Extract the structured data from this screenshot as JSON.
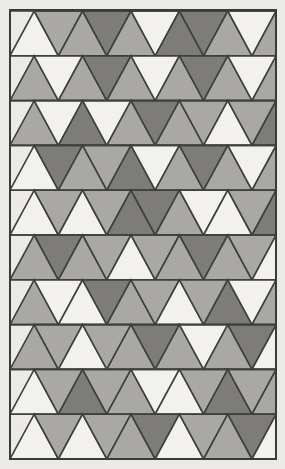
{
  "artwork": {
    "title": "Triangular Tessellation Pattern",
    "description": "Grid of equilateral triangles alternating point-up and point-down, filled with three gray tones",
    "canvas": {
      "width": 285,
      "height": 469
    },
    "background_color": "#eceae6",
    "border": {
      "color": "#3a3a38",
      "width": 2,
      "left": 10,
      "top": 10,
      "right": 276,
      "bottom": 459
    },
    "grid": {
      "origin_x": 10,
      "origin_y": 11,
      "rows": 10,
      "columns": 11,
      "half_base": 24.2,
      "row_height": 44.8,
      "stroke_color": "#3f3f3d",
      "stroke_width": 1.6
    },
    "palette": {
      "light": "#f2f1ee",
      "medium": "#a9a8a4",
      "dark": "#7d7c79"
    },
    "palette_names": [
      "light",
      "medium",
      "dark"
    ],
    "rows": [
      {
        "index": 1,
        "cells": [
          "light",
          "medium",
          "medium",
          "dark",
          "medium",
          "light",
          "dark",
          "dark",
          "medium",
          "light",
          "medium"
        ]
      },
      {
        "index": 2,
        "cells": [
          "medium",
          "light",
          "medium",
          "dark",
          "medium",
          "light",
          "medium",
          "dark",
          "medium",
          "light",
          "medium"
        ]
      },
      {
        "index": 3,
        "cells": [
          "medium",
          "light",
          "dark",
          "light",
          "medium",
          "dark",
          "medium",
          "medium",
          "light",
          "medium",
          "dark"
        ]
      },
      {
        "index": 4,
        "cells": [
          "light",
          "dark",
          "medium",
          "medium",
          "dark",
          "light",
          "medium",
          "dark",
          "medium",
          "light",
          "medium"
        ]
      },
      {
        "index": 5,
        "cells": [
          "light",
          "medium",
          "light",
          "medium",
          "dark",
          "dark",
          "medium",
          "light",
          "light",
          "medium",
          "dark"
        ]
      },
      {
        "index": 6,
        "cells": [
          "medium",
          "dark",
          "medium",
          "medium",
          "light",
          "medium",
          "medium",
          "dark",
          "medium",
          "medium",
          "light"
        ]
      },
      {
        "index": 7,
        "cells": [
          "medium",
          "light",
          "light",
          "dark",
          "medium",
          "medium",
          "light",
          "medium",
          "dark",
          "light",
          "medium"
        ]
      },
      {
        "index": 8,
        "cells": [
          "medium",
          "medium",
          "light",
          "medium",
          "medium",
          "dark",
          "medium",
          "light",
          "medium",
          "dark",
          "light"
        ]
      },
      {
        "index": 9,
        "cells": [
          "light",
          "medium",
          "dark",
          "medium",
          "medium",
          "light",
          "light",
          "medium",
          "dark",
          "medium",
          "medium"
        ]
      },
      {
        "index": 10,
        "cells": [
          "light",
          "medium",
          "light",
          "medium",
          "medium",
          "dark",
          "light",
          "medium",
          "medium",
          "dark",
          "light"
        ]
      }
    ]
  }
}
